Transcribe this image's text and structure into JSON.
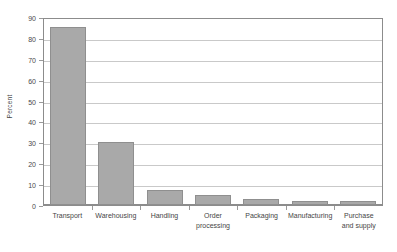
{
  "chart_data": {
    "type": "bar",
    "title": "",
    "xlabel": "",
    "ylabel": "Percent",
    "ylim": [
      0,
      90
    ],
    "yticks": [
      0,
      10,
      20,
      30,
      40,
      50,
      60,
      70,
      80,
      90
    ],
    "ytick_labels": [
      "0",
      "10",
      "20",
      "30",
      "40",
      "50",
      "60",
      "70",
      "80",
      "90"
    ],
    "grid": "horizontal",
    "legend": "none",
    "categories": [
      "Transport",
      "Warehousing",
      "Handling",
      "Order processing",
      "Packaging",
      "Manufacturing",
      "Purchase and supply"
    ],
    "category_lines": [
      [
        "Transport"
      ],
      [
        "Warehousing"
      ],
      [
        "Handling"
      ],
      [
        "Order",
        "processing"
      ],
      [
        "Packaging"
      ],
      [
        "Manufacturing"
      ],
      [
        "Purchase",
        "and supply"
      ]
    ],
    "values": [
      85,
      30,
      7,
      5,
      3,
      2,
      2
    ],
    "series": [
      {
        "name": "Percent",
        "values": [
          85,
          30,
          7,
          5,
          3,
          2,
          2
        ]
      }
    ],
    "colors": {
      "bar_fill": "#a9a9a9",
      "bar_border": "#8f8f8f",
      "gridline": "#c9c9c9",
      "axis": "#8c8c8c",
      "text": "#454545",
      "background": "#ffffff"
    }
  }
}
